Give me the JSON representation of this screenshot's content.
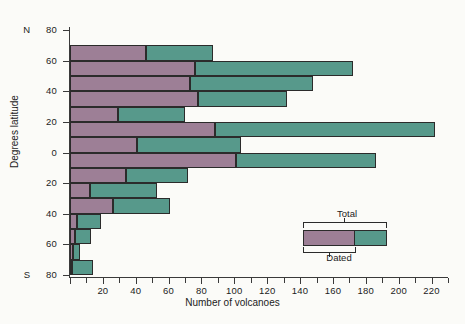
{
  "chart_data": {
    "type": "bar",
    "orientation": "horizontal",
    "title": "",
    "xlabel": "Number of volcanoes",
    "ylabel": "Degrees latitude",
    "xlim": [
      0,
      230
    ],
    "ylim": [
      -80,
      80
    ],
    "grid": false,
    "x_ticks": [
      0,
      20,
      40,
      60,
      80,
      100,
      120,
      140,
      160,
      180,
      200,
      220
    ],
    "x_tick_labels": [
      "",
      "20",
      "40",
      "60",
      "80",
      "100",
      "120",
      "140",
      "160",
      "180",
      "200",
      "220"
    ],
    "x_minor_tick_step": 10,
    "y_ticks": [
      80,
      60,
      40,
      20,
      0,
      -20,
      -40,
      -60,
      -80
    ],
    "y_tick_labels": [
      "80",
      "60",
      "40",
      "20",
      "0",
      "20",
      "40",
      "60",
      "80"
    ],
    "y_hemisphere_top": "N",
    "y_hemisphere_bottom": "S",
    "legend": {
      "position": "inside-lower-right",
      "entries": [
        {
          "name": "Total",
          "color": "#57998b"
        },
        {
          "name": "Dated",
          "color": "#9d7f96"
        }
      ]
    },
    "series": [
      {
        "name": "Dated",
        "color": "#9d7f96"
      },
      {
        "name": "Total",
        "color": "#57998b"
      }
    ],
    "categories": [
      "70-60 N",
      "60-50 N",
      "50-40 N",
      "40-30 N",
      "30-20 N",
      "20-10 N",
      "10-0 N",
      "0-10 S",
      "10-20 S",
      "20-30 S",
      "30-40 S",
      "40-50 S",
      "50-60 S",
      "60-70 S",
      "70-80 S"
    ],
    "bands": [
      {
        "band": "70-60 N",
        "lat_top": 70,
        "lat_bottom": 60,
        "dated": 46,
        "total": 87
      },
      {
        "band": "60-50 N",
        "lat_top": 60,
        "lat_bottom": 50,
        "dated": 76,
        "total": 172
      },
      {
        "band": "50-40 N",
        "lat_top": 50,
        "lat_bottom": 40,
        "dated": 73,
        "total": 148
      },
      {
        "band": "40-30 N",
        "lat_top": 40,
        "lat_bottom": 30,
        "dated": 78,
        "total": 132
      },
      {
        "band": "30-20 N",
        "lat_top": 30,
        "lat_bottom": 20,
        "dated": 29,
        "total": 70
      },
      {
        "band": "20-10 N",
        "lat_top": 20,
        "lat_bottom": 10,
        "dated": 88,
        "total": 222
      },
      {
        "band": "10-0 N",
        "lat_top": 10,
        "lat_bottom": 0,
        "dated": 41,
        "total": 104
      },
      {
        "band": "0-10 S",
        "lat_top": 0,
        "lat_bottom": -10,
        "dated": 101,
        "total": 186
      },
      {
        "band": "10-20 S",
        "lat_top": -10,
        "lat_bottom": -20,
        "dated": 34,
        "total": 72
      },
      {
        "band": "20-30 S",
        "lat_top": -20,
        "lat_bottom": -30,
        "dated": 12,
        "total": 53
      },
      {
        "band": "30-40 S",
        "lat_top": -30,
        "lat_bottom": -40,
        "dated": 26,
        "total": 61
      },
      {
        "band": "40-50 S",
        "lat_top": -40,
        "lat_bottom": -50,
        "dated": 4,
        "total": 19
      },
      {
        "band": "50-60 S",
        "lat_top": -50,
        "lat_bottom": -60,
        "dated": 3,
        "total": 13
      },
      {
        "band": "60-70 S",
        "lat_top": -60,
        "lat_bottom": -70,
        "dated": 2,
        "total": 6
      },
      {
        "band": "70-80 S",
        "lat_top": -70,
        "lat_bottom": -80,
        "dated": 1,
        "total": 14
      }
    ]
  }
}
